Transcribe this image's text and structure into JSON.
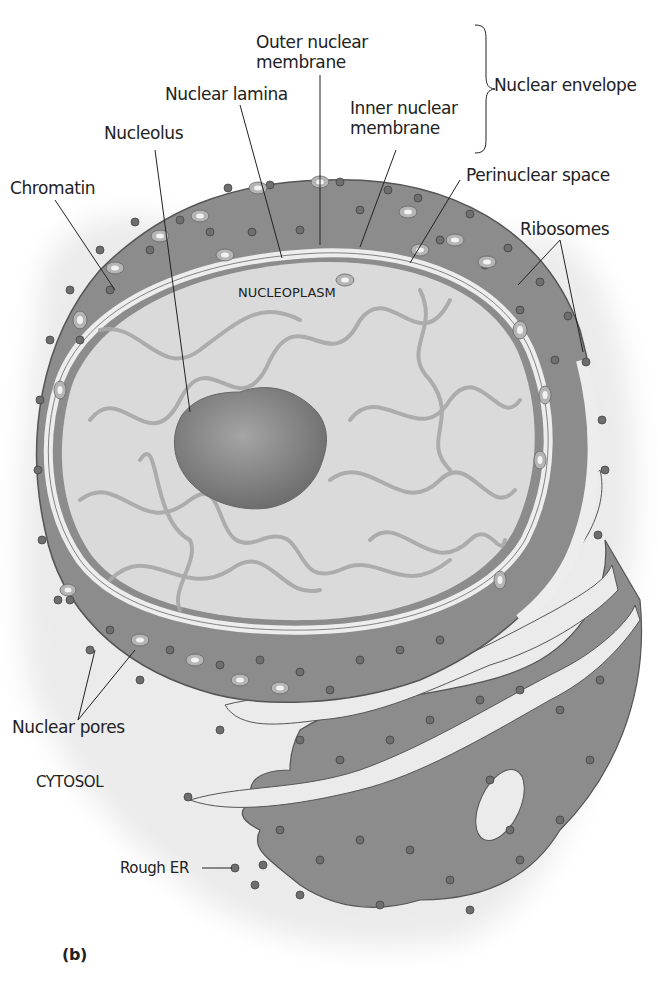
{
  "figure": {
    "panel_label": "(b)",
    "colors": {
      "background": "#ffffff",
      "cytosol": "#ebebeb",
      "envelope_fill": "#8c8c8c",
      "membrane": "#ededed",
      "nucleoplasm": "#dadada",
      "chromatin": "#a8a8a8",
      "nucleolus": "#7a7a7a",
      "ribosome": "#6e6e6e",
      "outline": "#555555",
      "text": "#222222"
    }
  },
  "labels": {
    "outer_nuclear_membrane": [
      "Outer nuclear",
      "membrane"
    ],
    "nuclear_lamina": "Nuclear lamina",
    "inner_nuclear_membrane": [
      "Inner nuclear",
      "membrane"
    ],
    "nuclear_envelope": "Nuclear envelope",
    "nucleolus": "Nucleolus",
    "chromatin": "Chromatin",
    "perinuclear_space": "Perinuclear space",
    "ribosomes": "Ribosomes",
    "nucleoplasm": "NUCLEOPLASM",
    "nuclear_pores": "Nuclear pores",
    "cytosol": "CYTOSOL",
    "rough_er": "Rough ER"
  }
}
